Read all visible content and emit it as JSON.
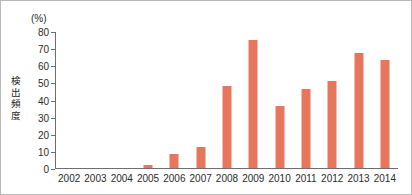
{
  "chart_data": {
    "type": "bar",
    "title": "",
    "subtitle": "",
    "xlabel": "",
    "ylabel": "検出頻度",
    "unit_label": "(%)",
    "categories": [
      "2002",
      "2003",
      "2004",
      "2005",
      "2006",
      "2007",
      "2008",
      "2009",
      "2010",
      "2011",
      "2012",
      "2013",
      "2014"
    ],
    "values": [
      0,
      0,
      0,
      2,
      8,
      12,
      48,
      75,
      36,
      46,
      51,
      67,
      63
    ],
    "ylim": [
      0,
      80
    ],
    "yticks": [
      0,
      10,
      20,
      30,
      40,
      50,
      60,
      70,
      80
    ],
    "ytick_labels": [
      "0",
      "10",
      "20",
      "30",
      "40",
      "50",
      "60",
      "70",
      "80"
    ],
    "grid": false,
    "legend": false,
    "bar_color": "#e8765c",
    "axis_color": "#6e6e6e",
    "frame_color": "#b9b9b9"
  }
}
